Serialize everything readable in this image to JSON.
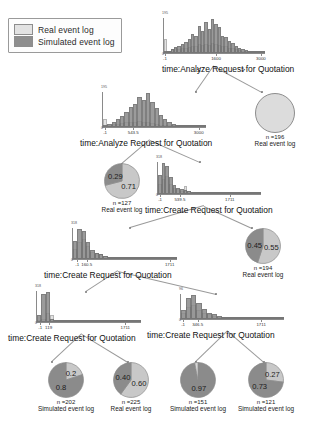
{
  "legend": {
    "items": [
      {
        "label": "Real event log",
        "color": "#e2e2e2",
        "key": "real"
      },
      {
        "label": "Simulated event log",
        "color": "#8e8e8e",
        "key": "sim"
      }
    ]
  },
  "edge_labels": {
    "lte": "≤",
    "gt": ">"
  },
  "chart_data": {
    "type": "diagram",
    "histograms": [
      {
        "id": "hist-analyze-1",
        "title": "time:Analyze Request for Quotation",
        "xlabel": "",
        "ylabel": "",
        "ytop": "195",
        "ybot": "0",
        "xticks": [
          "-1",
          "1600",
          "3000"
        ],
        "xtick_pos": [
          0.02,
          0.52,
          0.96
        ],
        "series": [
          {
            "name": "Real event log",
            "values": [
              34,
              6,
              9,
              11,
              10,
              12,
              13,
              14,
              18,
              16,
              21,
              20,
              22,
              19,
              23,
              22,
              20,
              16,
              16,
              13,
              11,
              9,
              7,
              5,
              4,
              3,
              2,
              2,
              1,
              1
            ]
          },
          {
            "name": "Simulated event log",
            "values": [
              3,
              5,
              10,
              14,
              16,
              22,
              27,
              34,
              45,
              41,
              66,
              52,
              74,
              58,
              82,
              71,
              62,
              40,
              38,
              30,
              24,
              18,
              13,
              9,
              7,
              5,
              3,
              2,
              1,
              1
            ]
          }
        ]
      },
      {
        "id": "hist-analyze-2",
        "title": "time:Analyze Request for Quotation",
        "ytop": "195",
        "ybot": "0",
        "xticks": [
          "-1",
          "543.5",
          "3000"
        ],
        "xtick_pos": [
          0.03,
          0.3,
          0.93
        ],
        "series": [
          {
            "name": "Real event log",
            "values": [
              22,
              5,
              7,
              8,
              10,
              12,
              14,
              13,
              16,
              14,
              12,
              10,
              8,
              6,
              4,
              3,
              2,
              1,
              1,
              1,
              0,
              0,
              0,
              0
            ]
          },
          {
            "name": "Simulated event log",
            "values": [
              4,
              8,
              14,
              20,
              28,
              40,
              52,
              60,
              78,
              70,
              88,
              64,
              50,
              30,
              20,
              12,
              7,
              4,
              2,
              1,
              1,
              0,
              0,
              0
            ]
          }
        ]
      },
      {
        "id": "hist-create-1",
        "title": "time:Create Request for Quotation",
        "ytop": "318",
        "ybot": "0",
        "xticks": [
          "-1",
          "539.5",
          "1711"
        ],
        "xtick_pos": [
          0.03,
          0.22,
          0.7
        ],
        "series": [
          {
            "name": "Real event log",
            "values": [
              30,
              44,
              52,
              30,
              18,
              14,
              10,
              22,
              8,
              5,
              4,
              3,
              2,
              2,
              1,
              1,
              1,
              0,
              0,
              0,
              0,
              0,
              0,
              0,
              0,
              0,
              0,
              0
            ]
          },
          {
            "name": "Simulated event log",
            "values": [
              56,
              90,
              80,
              50,
              26,
              18,
              14,
              12,
              9,
              6,
              4,
              3,
              2,
              2,
              1,
              1,
              1,
              0,
              0,
              0,
              0,
              0,
              0,
              0,
              0,
              0,
              0,
              0
            ]
          }
        ]
      },
      {
        "id": "hist-create-2",
        "title": "time:Create Request for Quotation",
        "ytop": "318",
        "ybot": "0",
        "xticks": [
          "-1",
          "160.5",
          "1711"
        ],
        "xtick_pos": [
          0.05,
          0.14,
          0.93
        ],
        "series": [
          {
            "name": "Real event log",
            "values": [
              36,
              60,
              70,
              46,
              26,
              20,
              16,
              10,
              4,
              2,
              1,
              0,
              0,
              0,
              0,
              0,
              0,
              0,
              0,
              0,
              0,
              0,
              0,
              0
            ]
          },
          {
            "name": "Simulated event log",
            "values": [
              62,
              104,
              96,
              58,
              30,
              22,
              18,
              12,
              5,
              2,
              1,
              0,
              0,
              0,
              0,
              0,
              0,
              0,
              0,
              0,
              0,
              0,
              0,
              0
            ]
          }
        ]
      },
      {
        "id": "hist-create-3",
        "title": "time:Create Request for Quotation",
        "ytop": "318",
        "ybot": "0",
        "xticks": [
          "-1",
          "119",
          "1711"
        ],
        "xtick_pos": [
          0.04,
          0.12,
          0.85
        ],
        "series": [
          {
            "name": "Real event log",
            "values": [
              10,
              18,
              50,
              40,
              0,
              0,
              0,
              0,
              0,
              0,
              0,
              0,
              0,
              0,
              0,
              0,
              0,
              0,
              0,
              0,
              0,
              0,
              0,
              0
            ]
          },
          {
            "name": "Simulated event log",
            "values": [
              40,
              150,
              160,
              18,
              0,
              0,
              0,
              0,
              0,
              0,
              0,
              0,
              0,
              0,
              0,
              0,
              0,
              0,
              0,
              0,
              0,
              0,
              0,
              0
            ]
          }
        ]
      },
      {
        "id": "hist-create-4",
        "title": "time:Create Request for Quotation",
        "ytop": "96",
        "ybot": "0",
        "xticks": [
          "-1",
          "346.5",
          "1711"
        ],
        "xtick_pos": [
          0.03,
          0.17,
          0.78
        ],
        "series": [
          {
            "name": "Real event log",
            "values": [
              14,
              26,
              30,
              20,
              14,
              10,
              7,
              5,
              3,
              2,
              1,
              1,
              0,
              0,
              0,
              0,
              0,
              0,
              0,
              0
            ]
          },
          {
            "name": "Simulated event log",
            "values": [
              20,
              46,
              52,
              34,
              22,
              14,
              10,
              7,
              4,
              2,
              1,
              1,
              0,
              0,
              0,
              0,
              0,
              0,
              0,
              0
            ]
          }
        ]
      }
    ],
    "leaves": [
      {
        "id": "leaf-n196",
        "kind": "circle",
        "n": "n =196",
        "source": "Real event log",
        "fill": "#dcdcdc"
      },
      {
        "id": "leaf-n127",
        "kind": "pie",
        "n": "n =127",
        "source": "Real event log",
        "slices": [
          {
            "value": "0.71",
            "fraction": 0.71,
            "color": "#c8c8c8"
          },
          {
            "value": "0.29",
            "fraction": 0.29,
            "color": "#8b8b8b"
          }
        ]
      },
      {
        "id": "leaf-n194",
        "kind": "pie",
        "n": "n =194",
        "source": "Real event log",
        "slices": [
          {
            "value": "0.55",
            "fraction": 0.55,
            "color": "#c8c8c8"
          },
          {
            "value": "0.45",
            "fraction": 0.45,
            "color": "#8b8b8b"
          }
        ]
      },
      {
        "id": "leaf-n202",
        "kind": "pie",
        "n": "n =202",
        "source": "Simulated event log",
        "slices": [
          {
            "value": "0.2",
            "fraction": 0.2,
            "color": "#c8c8c8"
          },
          {
            "value": "0.8",
            "fraction": 0.8,
            "color": "#8b8b8b"
          }
        ]
      },
      {
        "id": "leaf-n225",
        "kind": "pie",
        "n": "n =225",
        "source": "Real event log",
        "slices": [
          {
            "value": "0.60",
            "fraction": 0.6,
            "color": "#c8c8c8"
          },
          {
            "value": "0.40",
            "fraction": 0.4,
            "color": "#8b8b8b"
          }
        ]
      },
      {
        "id": "leaf-n151",
        "kind": "pie",
        "n": "n =151",
        "source": "Simulated event log",
        "slices": [
          {
            "value": "0.97",
            "fraction": 0.97,
            "color": "#8b8b8b"
          },
          {
            "value": "0.03",
            "fraction": 0.03,
            "color": "#d8d8d8"
          }
        ]
      },
      {
        "id": "leaf-n121",
        "kind": "pie",
        "n": "n =121",
        "source": "Simulated event log",
        "slices": [
          {
            "value": "0.27",
            "fraction": 0.27,
            "color": "#c8c8c8"
          },
          {
            "value": "0.73",
            "fraction": 0.73,
            "color": "#8b8b8b"
          }
        ]
      }
    ]
  }
}
